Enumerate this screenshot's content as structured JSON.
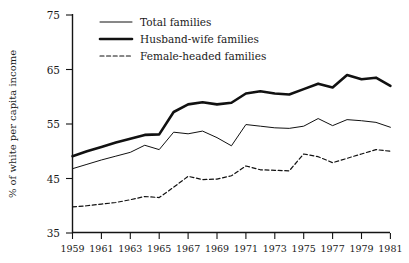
{
  "chart_data": {
    "type": "line",
    "title": "",
    "xlabel": "",
    "ylabel": "% of white per capita income",
    "xlim": [
      1959,
      1981
    ],
    "ylim": [
      35,
      75
    ],
    "grid": false,
    "legend_position": "top-left",
    "x": [
      1959,
      1960,
      1961,
      1962,
      1963,
      1964,
      1965,
      1966,
      1967,
      1968,
      1969,
      1970,
      1971,
      1972,
      1973,
      1974,
      1975,
      1976,
      1977,
      1978,
      1979,
      1980,
      1981
    ],
    "xticks": [
      "1959",
      "1961",
      "1963",
      "1965",
      "1967",
      "1969",
      "1971",
      "1973",
      "1975",
      "1977",
      "1979",
      "1981"
    ],
    "yticks": [
      "35",
      "45",
      "55",
      "65",
      "75"
    ],
    "series": [
      {
        "name": "Total families",
        "style": "thin-solid",
        "values": [
          46.8,
          47.6,
          48.4,
          49.1,
          49.8,
          51.1,
          50.3,
          53.5,
          53.2,
          53.7,
          52.5,
          51.0,
          54.9,
          54.6,
          54.3,
          54.2,
          54.6,
          56.0,
          54.7,
          55.8,
          55.6,
          55.3,
          54.4
        ]
      },
      {
        "name": "Husband-wife families",
        "style": "thick-solid",
        "values": [
          49.1,
          50.0,
          50.8,
          51.6,
          52.3,
          53.0,
          53.1,
          57.2,
          58.6,
          59.0,
          58.6,
          58.9,
          60.6,
          61.0,
          60.6,
          60.4,
          61.4,
          62.4,
          61.7,
          64.0,
          63.2,
          63.5,
          62.0
        ]
      },
      {
        "name": "Female-headed families",
        "style": "dashed",
        "values": [
          39.8,
          40.0,
          40.3,
          40.6,
          41.1,
          41.7,
          41.5,
          43.4,
          45.4,
          44.8,
          44.9,
          45.5,
          47.3,
          46.6,
          46.5,
          46.4,
          49.5,
          49.0,
          47.9,
          48.7,
          49.5,
          50.3,
          50.0
        ]
      }
    ]
  },
  "legend": {
    "items": [
      {
        "label": "Total families",
        "style": "thin-solid"
      },
      {
        "label": "Husband-wife families",
        "style": "thick-solid"
      },
      {
        "label": "Female-headed families",
        "style": "dashed"
      }
    ]
  },
  "axes": {
    "y_title": "% of white per capita income",
    "y_tick_labels": [
      "75",
      "65",
      "55",
      "45",
      "35"
    ],
    "x_tick_labels": [
      "1959",
      "1961",
      "1963",
      "1965",
      "1967",
      "1969",
      "1971",
      "1973",
      "1975",
      "1977",
      "1979",
      "1981"
    ]
  }
}
